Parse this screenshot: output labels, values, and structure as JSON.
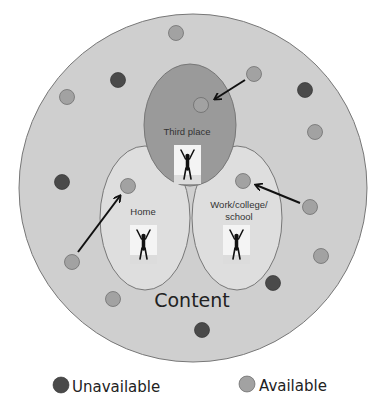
{
  "diagram": {
    "outer_label": "Content",
    "places": [
      {
        "id": "third-place",
        "label": "Third place"
      },
      {
        "id": "home",
        "label": "Home"
      },
      {
        "id": "work",
        "label_lines": [
          "Work/college/",
          "school"
        ]
      }
    ],
    "legend": {
      "unavailable": "Unavailable",
      "available": "Available"
    },
    "colors": {
      "outer_circle": "#cfcfcf",
      "third_place": "#9a9a9a",
      "home": "#dedede",
      "work": "#dedede",
      "available_dot": "#a2a2a2",
      "unavailable_dot": "#4a4a4a",
      "arrow": "#111111"
    },
    "available_count": 11,
    "unavailable_count": 5
  }
}
